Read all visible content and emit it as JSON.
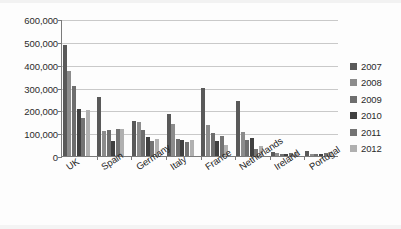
{
  "chart_data": {
    "type": "bar",
    "title": "",
    "subtitle": "",
    "xlabel": "",
    "ylabel": "",
    "categories": [
      "UK",
      "Spain",
      "Germany",
      "Italy",
      "France",
      "Netherlands",
      "Ireland",
      "Portugal"
    ],
    "series": [
      {
        "name": "2007",
        "color": "#595959",
        "values": [
          485000,
          260000,
          155000,
          183000,
          298000,
          240000,
          18000,
          22000
        ]
      },
      {
        "name": "2008",
        "color": "#8c8c8c",
        "values": [
          373000,
          108000,
          147000,
          140000,
          136000,
          106000,
          12000,
          11000
        ]
      },
      {
        "name": "2009",
        "color": "#6e6e6e",
        "values": [
          305000,
          112000,
          113000,
          76000,
          99000,
          68000,
          11000,
          9000
        ]
      },
      {
        "name": "2010",
        "color": "#404040",
        "values": [
          208000,
          67000,
          84000,
          71000,
          64000,
          80000,
          10000,
          8000
        ]
      },
      {
        "name": "2011",
        "color": "#737373",
        "values": [
          167000,
          120000,
          67000,
          63000,
          88000,
          30000,
          13000,
          13000
        ]
      },
      {
        "name": "2012",
        "color": "#b0b0b0",
        "values": [
          203000,
          120000,
          74000,
          72000,
          50000,
          45000,
          16000,
          16000
        ]
      }
    ],
    "ylim": [
      0,
      600000
    ],
    "ytick_values": [
      0,
      100000,
      200000,
      300000,
      400000,
      500000,
      600000
    ],
    "ytick_labels": [
      "0",
      "100,000",
      "200,000",
      "300,000",
      "400,000",
      "500,000",
      "600,000"
    ],
    "grid": true,
    "legend_position": "right",
    "legend_entries": [
      "2007",
      "2008",
      "2009",
      "2010",
      "2011",
      "2012"
    ]
  },
  "colors": {
    "axis": "#7b7b7b",
    "grid": "#c9c9c9",
    "text": "#2b2b2b",
    "background": "#fdfdfd"
  }
}
